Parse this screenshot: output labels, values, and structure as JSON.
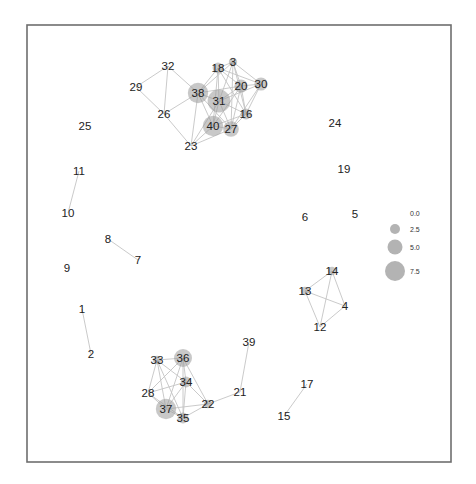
{
  "chart_data": {
    "type": "network",
    "title": "",
    "frame": {
      "x": 27,
      "y": 25,
      "w": 424,
      "h": 437
    },
    "nodes": [
      {
        "id": "32",
        "x": 168,
        "y": 66,
        "size": 0
      },
      {
        "id": "29",
        "x": 136,
        "y": 87,
        "size": 0
      },
      {
        "id": "26",
        "x": 164,
        "y": 114,
        "size": 0
      },
      {
        "id": "38",
        "x": 198,
        "y": 93,
        "size": 6
      },
      {
        "id": "18",
        "x": 218,
        "y": 68,
        "size": 2
      },
      {
        "id": "3",
        "x": 233,
        "y": 62,
        "size": 1
      },
      {
        "id": "20",
        "x": 241,
        "y": 86,
        "size": 3
      },
      {
        "id": "30",
        "x": 261,
        "y": 84,
        "size": 3
      },
      {
        "id": "31",
        "x": 219,
        "y": 101,
        "size": 7
      },
      {
        "id": "16",
        "x": 246,
        "y": 114,
        "size": 2
      },
      {
        "id": "40",
        "x": 213,
        "y": 126,
        "size": 6
      },
      {
        "id": "27",
        "x": 231,
        "y": 129,
        "size": 4
      },
      {
        "id": "23",
        "x": 191,
        "y": 146,
        "size": 0
      },
      {
        "id": "25",
        "x": 85,
        "y": 126,
        "size": 0
      },
      {
        "id": "24",
        "x": 335,
        "y": 123,
        "size": 0
      },
      {
        "id": "19",
        "x": 344,
        "y": 169,
        "size": 0
      },
      {
        "id": "11",
        "x": 79,
        "y": 171,
        "size": 0
      },
      {
        "id": "10",
        "x": 68,
        "y": 213,
        "size": 0
      },
      {
        "id": "6",
        "x": 305,
        "y": 217,
        "size": 0
      },
      {
        "id": "5",
        "x": 355,
        "y": 214,
        "size": 0
      },
      {
        "id": "8",
        "x": 108,
        "y": 239,
        "size": 0
      },
      {
        "id": "7",
        "x": 138,
        "y": 260,
        "size": 0
      },
      {
        "id": "9",
        "x": 67,
        "y": 268,
        "size": 0
      },
      {
        "id": "14",
        "x": 332,
        "y": 271,
        "size": 1
      },
      {
        "id": "13",
        "x": 305,
        "y": 291,
        "size": 1
      },
      {
        "id": "4",
        "x": 345,
        "y": 306,
        "size": 0
      },
      {
        "id": "12",
        "x": 320,
        "y": 327,
        "size": 0
      },
      {
        "id": "1",
        "x": 82,
        "y": 309,
        "size": 0
      },
      {
        "id": "2",
        "x": 91,
        "y": 354,
        "size": 0
      },
      {
        "id": "39",
        "x": 249,
        "y": 342,
        "size": 0
      },
      {
        "id": "21",
        "x": 240,
        "y": 392,
        "size": 0
      },
      {
        "id": "33",
        "x": 157,
        "y": 360,
        "size": 1
      },
      {
        "id": "36",
        "x": 183,
        "y": 358,
        "size": 5
      },
      {
        "id": "34",
        "x": 186,
        "y": 382,
        "size": 2
      },
      {
        "id": "28",
        "x": 148,
        "y": 393,
        "size": 0
      },
      {
        "id": "37",
        "x": 166,
        "y": 409,
        "size": 6
      },
      {
        "id": "35",
        "x": 183,
        "y": 418,
        "size": 2
      },
      {
        "id": "22",
        "x": 208,
        "y": 404,
        "size": 1
      },
      {
        "id": "17",
        "x": 307,
        "y": 384,
        "size": 0
      },
      {
        "id": "15",
        "x": 284,
        "y": 416,
        "size": 0
      }
    ],
    "edges": [
      [
        "32",
        "29"
      ],
      [
        "32",
        "26"
      ],
      [
        "32",
        "38"
      ],
      [
        "29",
        "26"
      ],
      [
        "26",
        "38"
      ],
      [
        "26",
        "23"
      ],
      [
        "38",
        "18"
      ],
      [
        "38",
        "31"
      ],
      [
        "38",
        "3"
      ],
      [
        "38",
        "20"
      ],
      [
        "38",
        "40"
      ],
      [
        "38",
        "27"
      ],
      [
        "38",
        "23"
      ],
      [
        "18",
        "3"
      ],
      [
        "18",
        "31"
      ],
      [
        "18",
        "20"
      ],
      [
        "18",
        "16"
      ],
      [
        "18",
        "40"
      ],
      [
        "18",
        "30"
      ],
      [
        "3",
        "31"
      ],
      [
        "3",
        "20"
      ],
      [
        "3",
        "30"
      ],
      [
        "3",
        "16"
      ],
      [
        "3",
        "27"
      ],
      [
        "20",
        "30"
      ],
      [
        "20",
        "31"
      ],
      [
        "20",
        "16"
      ],
      [
        "20",
        "27"
      ],
      [
        "20",
        "40"
      ],
      [
        "30",
        "16"
      ],
      [
        "30",
        "31"
      ],
      [
        "30",
        "27"
      ],
      [
        "31",
        "16"
      ],
      [
        "31",
        "40"
      ],
      [
        "31",
        "27"
      ],
      [
        "31",
        "23"
      ],
      [
        "16",
        "40"
      ],
      [
        "16",
        "27"
      ],
      [
        "40",
        "27"
      ],
      [
        "40",
        "23"
      ],
      [
        "27",
        "23"
      ],
      [
        "11",
        "10"
      ],
      [
        "8",
        "7"
      ],
      [
        "1",
        "2"
      ],
      [
        "14",
        "13"
      ],
      [
        "14",
        "4"
      ],
      [
        "14",
        "12"
      ],
      [
        "13",
        "4"
      ],
      [
        "13",
        "12"
      ],
      [
        "4",
        "12"
      ],
      [
        "39",
        "21"
      ],
      [
        "21",
        "22"
      ],
      [
        "33",
        "36"
      ],
      [
        "33",
        "34"
      ],
      [
        "33",
        "28"
      ],
      [
        "33",
        "37"
      ],
      [
        "33",
        "35"
      ],
      [
        "36",
        "34"
      ],
      [
        "36",
        "28"
      ],
      [
        "36",
        "37"
      ],
      [
        "36",
        "35"
      ],
      [
        "36",
        "22"
      ],
      [
        "34",
        "28"
      ],
      [
        "34",
        "37"
      ],
      [
        "34",
        "35"
      ],
      [
        "34",
        "22"
      ],
      [
        "28",
        "37"
      ],
      [
        "28",
        "35"
      ],
      [
        "37",
        "35"
      ],
      [
        "37",
        "22"
      ],
      [
        "35",
        "22"
      ],
      [
        "17",
        "15"
      ]
    ],
    "legend": {
      "position": "right",
      "title": "",
      "entries": [
        {
          "label": "0.0",
          "r": 0
        },
        {
          "label": "2.5",
          "r": 5
        },
        {
          "label": "5.0",
          "r": 7.5
        },
        {
          "label": "7.5",
          "r": 10
        }
      ]
    }
  }
}
